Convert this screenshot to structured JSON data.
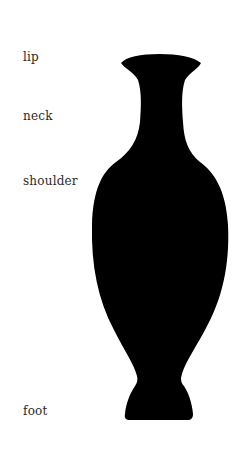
{
  "diagram": {
    "type": "vase-anatomy",
    "labels": [
      {
        "id": "lip",
        "text": "lip"
      },
      {
        "id": "neck",
        "text": "neck"
      },
      {
        "id": "shoulder",
        "text": "shoulder"
      },
      {
        "id": "foot",
        "text": "foot"
      }
    ],
    "silhouette_color": "#000000",
    "background_color": "#ffffff"
  }
}
